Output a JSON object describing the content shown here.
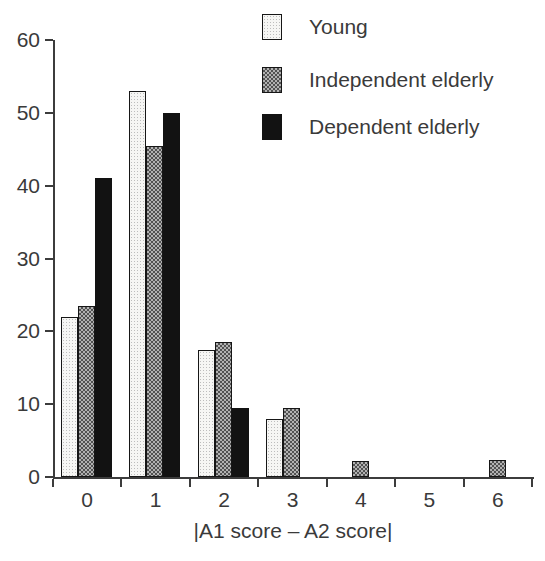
{
  "chart_data": {
    "type": "bar",
    "categories": [
      "0",
      "1",
      "2",
      "3",
      "4",
      "5",
      "6"
    ],
    "series": [
      {
        "name": "Young",
        "pattern": "stipple",
        "values": [
          22,
          53,
          17.5,
          8,
          0,
          0,
          0
        ]
      },
      {
        "name": "Independent elderly",
        "pattern": "checker",
        "values": [
          23.5,
          45.5,
          18.5,
          9.5,
          2.2,
          0,
          2.3
        ]
      },
      {
        "name": "Dependent elderly",
        "pattern": "solid",
        "values": [
          41,
          50,
          9.5,
          0,
          0,
          0,
          0
        ]
      }
    ],
    "title": "",
    "xlabel": "|A1 score – A2 score|",
    "ylabel": "",
    "ylim": [
      0,
      60
    ],
    "yticks": [
      0,
      10,
      20,
      30,
      40,
      50,
      60
    ],
    "grid": false,
    "legend_position": "top-right"
  },
  "colors": {
    "axis": "#3c3c3c",
    "text": "#3a3a3a",
    "solid_fill": "#121212",
    "checker_dark": "#525252",
    "checker_light": "#b2b2b2",
    "stipple_dot": "#bdbdbd",
    "stipple_bg": "#f6f6f4",
    "background": "#ffffff"
  }
}
